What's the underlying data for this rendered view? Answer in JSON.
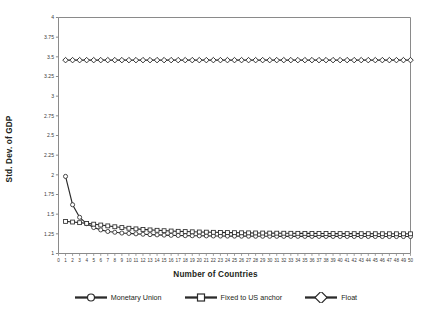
{
  "chart_data": {
    "type": "line",
    "title": "",
    "xlabel": "Number of Countries",
    "ylabel": "Std. Dev. of GDP",
    "xlim": [
      0,
      50
    ],
    "ylim": [
      1,
      4
    ],
    "ytick_step": 0.25,
    "xtick_step": 1,
    "grid": false,
    "legend_position": "bottom",
    "xticks": [
      0,
      1,
      2,
      3,
      4,
      5,
      6,
      7,
      8,
      9,
      10,
      11,
      12,
      13,
      14,
      15,
      16,
      17,
      18,
      19,
      20,
      21,
      22,
      23,
      24,
      25,
      26,
      27,
      28,
      29,
      30,
      31,
      32,
      33,
      34,
      35,
      36,
      37,
      38,
      39,
      40,
      41,
      42,
      43,
      44,
      45,
      46,
      47,
      48,
      49,
      50
    ],
    "yticks": [
      1,
      1.25,
      1.5,
      1.75,
      2,
      2.25,
      2.5,
      2.75,
      3,
      3.25,
      3.5,
      3.75,
      4
    ],
    "ytick_labels": [
      "1",
      "1.25",
      "1.5",
      "1.75",
      "2",
      "2.25",
      "2.5",
      "2.75",
      "3",
      "3.25",
      "3.5",
      "3.75",
      "4"
    ],
    "x": [
      1,
      2,
      3,
      4,
      5,
      6,
      7,
      8,
      9,
      10,
      11,
      12,
      13,
      14,
      15,
      16,
      17,
      18,
      19,
      20,
      21,
      22,
      23,
      24,
      25,
      26,
      27,
      28,
      29,
      30,
      31,
      32,
      33,
      34,
      35,
      36,
      37,
      38,
      39,
      40,
      41,
      42,
      43,
      44,
      45,
      46,
      47,
      48,
      49,
      50
    ],
    "series": [
      {
        "name": "Monetary Union",
        "marker": "circle",
        "color": "#2b2b2b",
        "values": [
          1.98,
          1.62,
          1.46,
          1.38,
          1.33,
          1.3,
          1.28,
          1.27,
          1.26,
          1.255,
          1.25,
          1.245,
          1.24,
          1.237,
          1.234,
          1.231,
          1.229,
          1.227,
          1.226,
          1.225,
          1.224,
          1.223,
          1.222,
          1.2215,
          1.221,
          1.2205,
          1.22,
          1.2196,
          1.2192,
          1.2189,
          1.2186,
          1.2183,
          1.218,
          1.2178,
          1.2176,
          1.2174,
          1.2172,
          1.217,
          1.2169,
          1.2167,
          1.2166,
          1.2165,
          1.2164,
          1.2163,
          1.2162,
          1.2161,
          1.216,
          1.2159,
          1.2158,
          1.2157
        ]
      },
      {
        "name": "Fixed to US anchor",
        "marker": "square",
        "color": "#2b2b2b",
        "values": [
          1.408,
          1.4,
          1.392,
          1.383,
          1.373,
          1.362,
          1.351,
          1.34,
          1.33,
          1.321,
          1.313,
          1.306,
          1.3,
          1.295,
          1.29,
          1.286,
          1.282,
          1.279,
          1.276,
          1.2735,
          1.2715,
          1.2695,
          1.2678,
          1.2662,
          1.2648,
          1.2635,
          1.2623,
          1.2612,
          1.2602,
          1.2593,
          1.2585,
          1.2577,
          1.257,
          1.2563,
          1.2557,
          1.2551,
          1.2546,
          1.2541,
          1.2536,
          1.2532,
          1.2528,
          1.2524,
          1.2521,
          1.2518,
          1.2515,
          1.2512,
          1.2509,
          1.2507,
          1.2505,
          1.2503
        ]
      },
      {
        "name": "Float",
        "marker": "diamond",
        "color": "#2b2b2b",
        "values": [
          3.458,
          3.458,
          3.458,
          3.458,
          3.458,
          3.458,
          3.458,
          3.458,
          3.458,
          3.458,
          3.458,
          3.458,
          3.458,
          3.458,
          3.458,
          3.458,
          3.458,
          3.458,
          3.458,
          3.458,
          3.458,
          3.458,
          3.458,
          3.458,
          3.458,
          3.458,
          3.458,
          3.458,
          3.458,
          3.458,
          3.458,
          3.458,
          3.458,
          3.458,
          3.458,
          3.458,
          3.458,
          3.458,
          3.458,
          3.458,
          3.458,
          3.458,
          3.458,
          3.458,
          3.458,
          3.458,
          3.458,
          3.458,
          3.458,
          3.458
        ]
      }
    ]
  },
  "legend": {
    "items": [
      {
        "label": "Monetary Union",
        "marker": "circle"
      },
      {
        "label": "Fixed to US anchor",
        "marker": "square"
      },
      {
        "label": "Float",
        "marker": "diamond"
      }
    ]
  },
  "axes": {
    "x_title": "Number of Countries",
    "y_title": "Std. Dev. of GDP"
  }
}
